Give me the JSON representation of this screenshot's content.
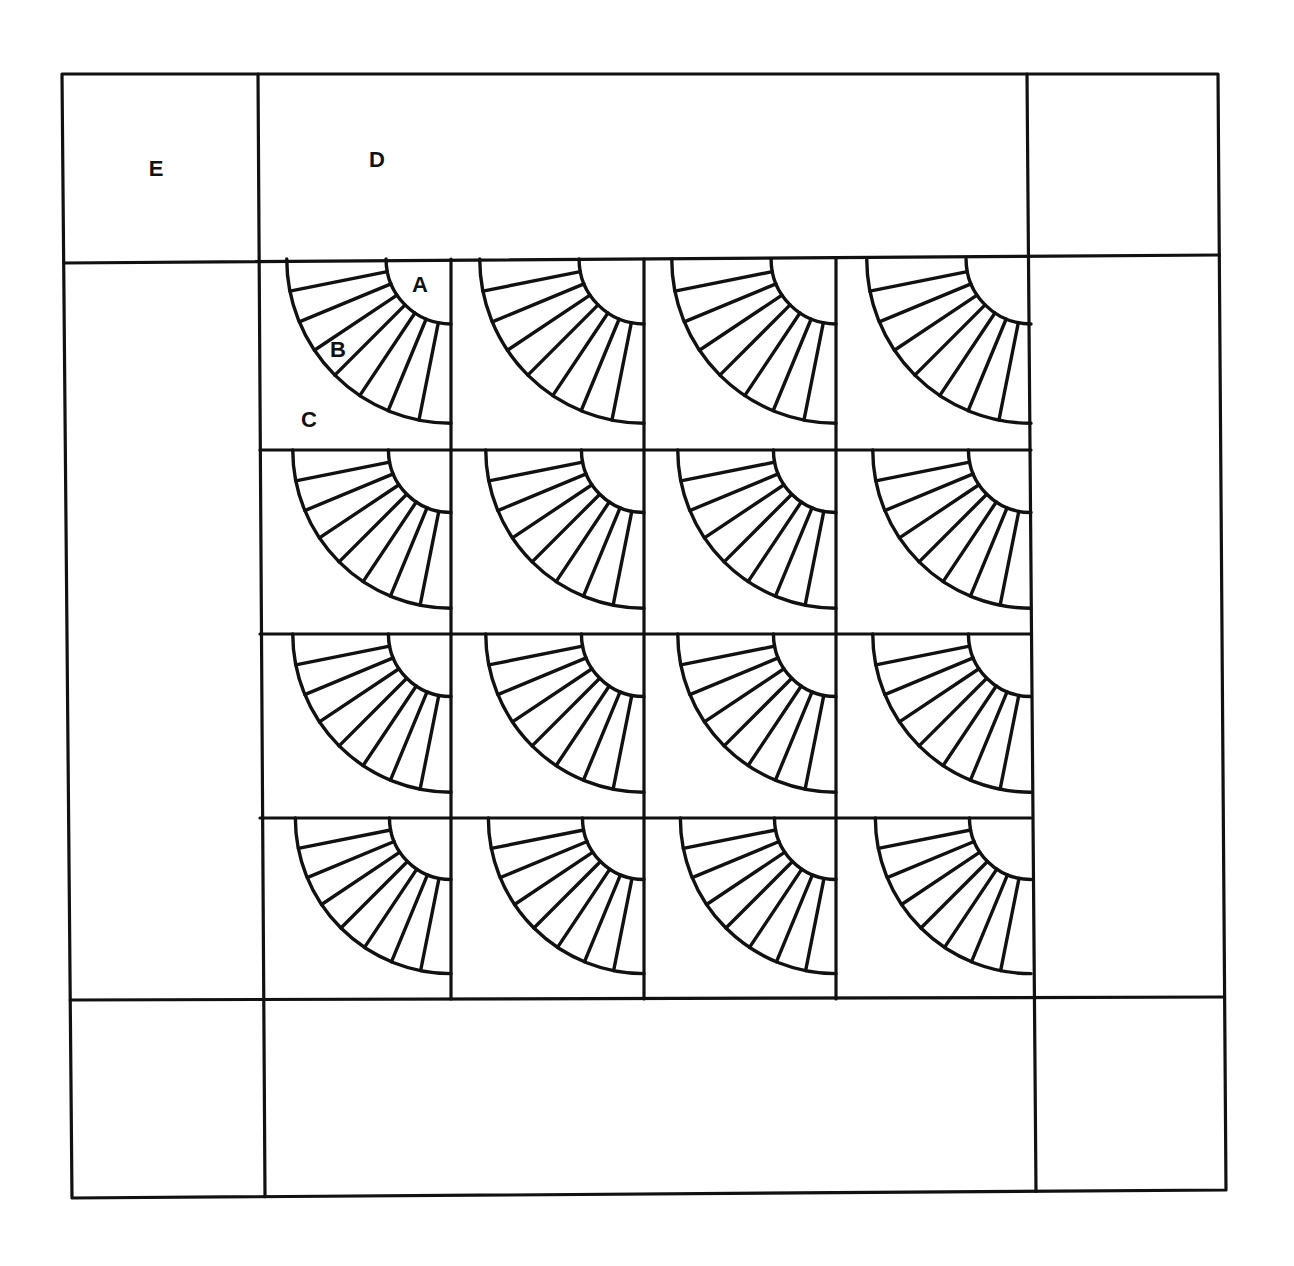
{
  "diagram": {
    "type": "quilt-layout",
    "stroke_color": "#111111",
    "background_color": "#ffffff",
    "outer_frame": {
      "top_left": [
        62,
        74
      ],
      "top_right": [
        1218,
        74
      ],
      "bottom_right": [
        1226,
        1190
      ],
      "bottom_left": [
        72,
        1198
      ]
    },
    "border_lines": {
      "vertical": [
        {
          "x_top": 258,
          "x_bottom": 265,
          "name": "left-border-seam"
        },
        {
          "x_top": 1027,
          "x_bottom": 1036,
          "name": "right-border-seam"
        }
      ],
      "horizontal": [
        {
          "y_left": 263,
          "y_right": 255,
          "name": "top-border-seam"
        },
        {
          "y_left": 1000,
          "y_right": 997,
          "name": "bottom-border-seam"
        }
      ]
    },
    "fan_grid": {
      "rows": 4,
      "cols": 4,
      "col_edges": [
        260,
        451,
        644,
        836,
        1031
      ],
      "row_edges": [
        259,
        450,
        634,
        818,
        999
      ],
      "blades_per_fan": 8
    },
    "labels": [
      {
        "id": "E",
        "text": "E",
        "x": 156,
        "y": 176,
        "meaning": "corner square"
      },
      {
        "id": "D",
        "text": "D",
        "x": 377,
        "y": 167,
        "meaning": "border strip"
      },
      {
        "id": "A",
        "text": "A",
        "x": 420,
        "y": 292,
        "meaning": "fan center quarter-circle"
      },
      {
        "id": "B",
        "text": "B",
        "x": 338,
        "y": 357,
        "meaning": "fan blade"
      },
      {
        "id": "C",
        "text": "C",
        "x": 309,
        "y": 427,
        "meaning": "block background"
      }
    ]
  }
}
